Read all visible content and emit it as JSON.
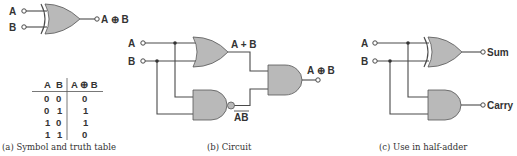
{
  "figure": {
    "panel_a": {
      "caption": "(a) Symbol and truth table",
      "gate_type": "XOR",
      "inputs": [
        "A",
        "B"
      ],
      "output_label": "A ⊕ B",
      "truth_table": {
        "headers": [
          "A",
          "B",
          "A ⊕ B"
        ],
        "rows": [
          [
            "0",
            "0",
            "0"
          ],
          [
            "0",
            "1",
            "1"
          ],
          [
            "1",
            "0",
            "1"
          ],
          [
            "1",
            "1",
            "0"
          ]
        ]
      }
    },
    "panel_b": {
      "caption": "(b) Circuit",
      "inputs": [
        "A",
        "B"
      ],
      "or_output_label": "A + B",
      "nand_output_label": "AB",
      "output_label": "A ⊕ B",
      "gates": [
        "OR",
        "NAND",
        "AND"
      ]
    },
    "panel_c": {
      "caption": "(c) Use in half-adder",
      "inputs": [
        "A",
        "B"
      ],
      "sum_label": "Sum",
      "carry_label": "Carry",
      "gates": [
        "XOR",
        "AND"
      ]
    }
  },
  "colors": {
    "gate_fill": "#b9b9b9",
    "line": "#4a4a4a",
    "text": "#333333"
  }
}
